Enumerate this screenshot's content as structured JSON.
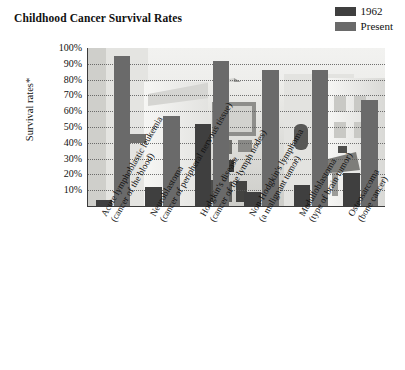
{
  "chart_data": {
    "type": "bar",
    "title": "Childhood Cancer Survival Rates",
    "xlabel": "",
    "ylabel": "Survival rates*",
    "ylim": [
      0,
      100
    ],
    "ytick_labels": [
      "100%",
      "90%",
      "80%",
      "70%",
      "60%",
      "50%",
      "40%",
      "30%",
      "20%",
      "10%"
    ],
    "ytick_values": [
      100,
      90,
      80,
      70,
      60,
      50,
      40,
      30,
      20,
      10
    ],
    "grid": true,
    "legend_position": "top-right",
    "categories": [
      "Acute lymphoblastic leukemia (cancer of the blood)",
      "Neuroblastoma (cancer of peripheral nervous tissue)",
      "Hodgkin's disease (cancer of the lymph nodes)",
      "Non-Hodgkin's lymphoma (a malignant tumor)",
      "Medulloblastoma (type of brain tumor)",
      "Osteosarcoma (bone cancer)"
    ],
    "category_lines": [
      [
        "Acute lymphoblastic leukemia",
        "(cancer of the blood)"
      ],
      [
        "Neuroblastoma",
        "(cancer of peripheral nervous tissue)"
      ],
      [
        "Hodgkin's disease",
        "(cancer of the lymph nodes)"
      ],
      [
        "Non-Hodgkin's lymphoma",
        "(a malignant tumor)"
      ],
      [
        "Medulloblastoma",
        "(type of brain tumor)"
      ],
      [
        "Osteosarcoma",
        "(bone cancer)"
      ]
    ],
    "series": [
      {
        "name": "1962",
        "color": "#3f3f3f",
        "values": [
          4,
          12,
          52,
          9,
          13,
          21
        ]
      },
      {
        "name": "Present",
        "color": "#6a6a6a",
        "values": [
          95,
          57,
          92,
          86,
          86,
          67
        ]
      }
    ]
  },
  "legend": {
    "items": [
      {
        "label": "1962",
        "color": "#3f3f3f"
      },
      {
        "label": "Present",
        "color": "#6a6a6a"
      }
    ]
  },
  "colors": {
    "series_1962": "#3f3f3f",
    "series_present": "#6a6a6a",
    "axis": "#3b3b3b",
    "gridline": "#5a5a5a",
    "background": "#ffffff"
  }
}
